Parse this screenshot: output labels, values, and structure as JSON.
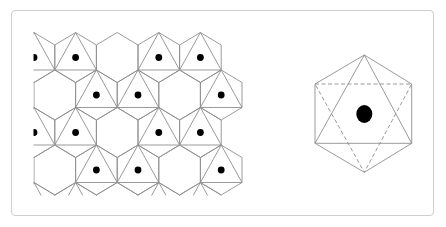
{
  "figure": {
    "frame": {
      "x": 11,
      "y": 10,
      "width": 421,
      "height": 204,
      "radius": 4,
      "border_color": "#cfcfcf"
    },
    "line_color": "#8e8e8e",
    "dot_color": "#000000"
  },
  "tiling": {
    "description": "Hexagonal tiling with inscribed upward triangles and centroid dots",
    "clip": {
      "x": 33.5,
      "y": 31,
      "width": 210,
      "height": 164.5
    },
    "origin_x": 34,
    "half_width": 20.8,
    "first_row_center_y": 57.5,
    "row_spacing": 37.5,
    "hex_half_height": 25,
    "shoulder_offset": 12.5,
    "dot_radius": 3.4,
    "rows": [
      {
        "columns": [
          0,
          2,
          4,
          6,
          8
        ],
        "has_triangle": [
          true,
          true,
          false,
          true,
          true
        ]
      },
      {
        "columns": [
          1,
          3,
          5,
          7,
          9
        ],
        "has_triangle": [
          false,
          true,
          true,
          false,
          true
        ]
      },
      {
        "columns": [
          0,
          2,
          4,
          6,
          8
        ],
        "has_triangle": [
          true,
          true,
          false,
          true,
          true
        ]
      },
      {
        "columns": [
          1,
          3,
          5,
          7,
          9
        ],
        "has_triangle": [
          false,
          true,
          true,
          false,
          true
        ]
      },
      {
        "columns": [
          0,
          2,
          4,
          6,
          8
        ],
        "has_triangle": [
          true,
          true,
          false,
          true,
          true
        ]
      }
    ]
  },
  "single_hexagon": {
    "description": "Hexagon with solid upward triangle, dashed downward triangle and central dot",
    "vertices": {
      "top": [
        364.3,
        55
      ],
      "upper_right": [
        411.7,
        84
      ],
      "lower_right": [
        411.7,
        143.3
      ],
      "bottom": [
        364.3,
        172.3
      ],
      "lower_left": [
        315,
        143.3
      ],
      "upper_left": [
        315,
        84
      ]
    },
    "solid_triangle": [
      "top",
      "lower_left",
      "lower_right"
    ],
    "dashed_triangle": [
      "upper_left",
      "upper_right",
      "bottom"
    ],
    "dot": {
      "cx": 364.3,
      "cy": 114,
      "rx": 8,
      "ry": 9
    }
  }
}
